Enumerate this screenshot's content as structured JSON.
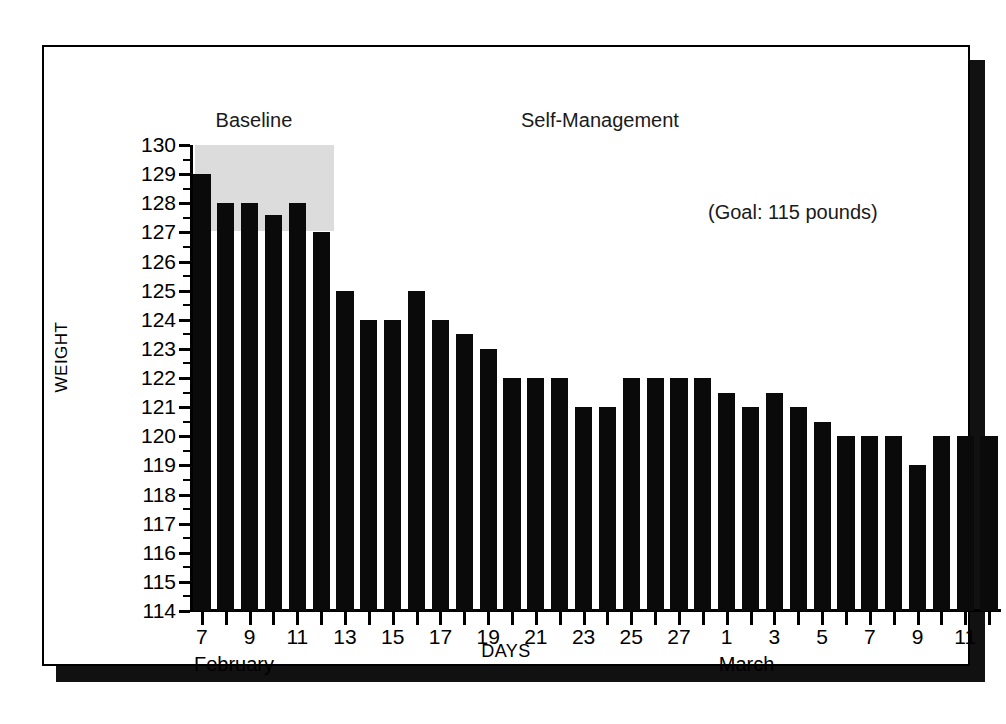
{
  "figure": {
    "axis_title_y": "WEIGHT",
    "axis_title_x": "DAYS",
    "phase_baseline": "Baseline",
    "phase_treatment": "Self-Management",
    "goal_note": "(Goal:  115 pounds)",
    "month_left": "February",
    "month_right": "March"
  },
  "chart_data": {
    "type": "bar",
    "title": "",
    "subtitle": "",
    "xlabel": "DAYS",
    "ylabel": "WEIGHT",
    "ylim": [
      114,
      130
    ],
    "ytick_step": 1,
    "yminor_step": 0.5,
    "grid": false,
    "legend": null,
    "bar_color": "#0a0a0a",
    "shade_color": "#dcdcdc",
    "annotations": [
      {
        "text": "Baseline",
        "kind": "phase-label",
        "covers_points": 6
      },
      {
        "text": "Self-Management",
        "kind": "phase-label"
      },
      {
        "text": "(Goal:  115 pounds)",
        "kind": "goal"
      }
    ],
    "phases": [
      {
        "name": "Baseline",
        "start_index": 0,
        "end_index": 5
      },
      {
        "name": "Self-Management",
        "start_index": 6,
        "end_index": 33
      }
    ],
    "categories": [
      "Feb 7",
      "Feb 8",
      "Feb 9",
      "Feb 10",
      "Feb 11",
      "Feb 12",
      "Feb 13",
      "Feb 14",
      "Feb 15",
      "Feb 16",
      "Feb 17",
      "Feb 18",
      "Feb 19",
      "Feb 20",
      "Feb 21",
      "Feb 22",
      "Feb 23",
      "Feb 24",
      "Feb 25",
      "Feb 26",
      "Feb 27",
      "Feb 28",
      "Mar 1",
      "Mar 2",
      "Mar 3",
      "Mar 4",
      "Mar 5",
      "Mar 6",
      "Mar 7",
      "Mar 8",
      "Mar 9",
      "Mar 10",
      "Mar 11",
      "Mar 12"
    ],
    "values": [
      129,
      128,
      128,
      127.6,
      128,
      127,
      125,
      124,
      124,
      125,
      124,
      123.5,
      123,
      122,
      122,
      122,
      121,
      121,
      122,
      122,
      122,
      122,
      121.5,
      121,
      121.5,
      121,
      120.5,
      120,
      120,
      120,
      119,
      120,
      120,
      120
    ],
    "ytick_labels": [
      "130",
      "129",
      "128",
      "127",
      "126",
      "125",
      "124",
      "123",
      "122",
      "121",
      "120",
      "119",
      "118",
      "117",
      "116",
      "115",
      "114"
    ],
    "xtick_labels": [
      "7",
      "",
      "9",
      "",
      "11",
      "",
      "13",
      "",
      "15",
      "",
      "17",
      "",
      "19",
      "",
      "21",
      "",
      "23",
      "",
      "25",
      "",
      "27",
      "",
      "1",
      "",
      "3",
      "",
      "5",
      "",
      "7",
      "",
      "9",
      "",
      "11",
      ""
    ]
  }
}
